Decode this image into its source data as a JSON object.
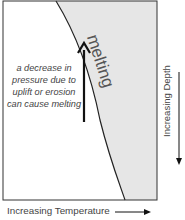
{
  "diagram": {
    "region_label": "melting",
    "caption": "a decrease in pressure due to uplift or erosion can cause melting",
    "y_axis_label": "Increasing Depth",
    "x_axis_label": "Increasing Temperature",
    "colors": {
      "melt_region": "#e6e6e6",
      "frame": "#333333",
      "text": "#444444"
    }
  }
}
